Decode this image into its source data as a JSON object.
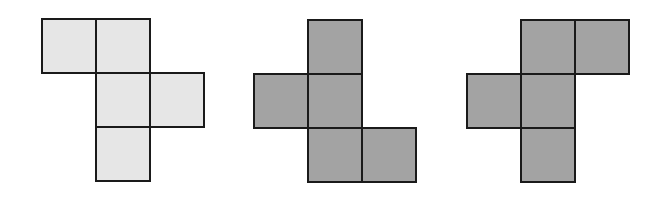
{
  "figure": {
    "cell_size": 54,
    "nets": [
      {
        "id": "net-1",
        "fill": "#e6e6e6",
        "origin": [
          42,
          19
        ],
        "cells": [
          [
            0,
            0
          ],
          [
            1,
            0
          ],
          [
            1,
            1
          ],
          [
            2,
            1
          ],
          [
            1,
            2
          ]
        ]
      },
      {
        "id": "net-2",
        "fill": "#a3a3a3",
        "origin": [
          254,
          20
        ],
        "cells": [
          [
            1,
            0
          ],
          [
            0,
            1
          ],
          [
            1,
            1
          ],
          [
            1,
            2
          ],
          [
            2,
            2
          ]
        ]
      },
      {
        "id": "net-3",
        "fill": "#a3a3a3",
        "origin": [
          467,
          20
        ],
        "cells": [
          [
            1,
            0
          ],
          [
            2,
            0
          ],
          [
            0,
            1
          ],
          [
            1,
            1
          ],
          [
            1,
            2
          ]
        ]
      }
    ]
  }
}
